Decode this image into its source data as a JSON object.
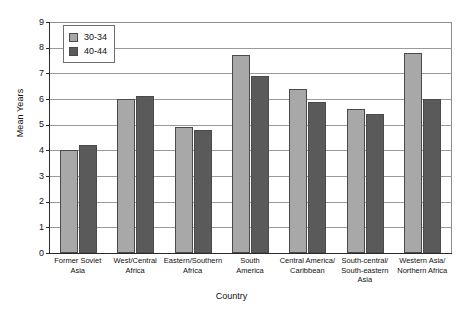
{
  "chart_data": {
    "type": "bar",
    "title": "",
    "xlabel": "Country",
    "ylabel": "Mean Years",
    "ylim": [
      0,
      9
    ],
    "yticks": [
      "0",
      "1",
      "2",
      "3",
      "4",
      "5",
      "6",
      "7",
      "8",
      "9"
    ],
    "grid": true,
    "legend_position": "top-left-inside",
    "categories": [
      "Former Soviet\nAsia",
      "West/Central\nAfrica",
      "Eastern/Southern\nAfrica",
      "South\nAmerica",
      "Central America/\nCaribbean",
      "South-central/\nSouth-eastern Asia",
      "Western Asia/\nNorthern Africa"
    ],
    "category_lines": [
      [
        "Former Soviet",
        "Asia"
      ],
      [
        "West/Central",
        "Africa"
      ],
      [
        "Eastern/Southern",
        "Africa"
      ],
      [
        "South",
        "America"
      ],
      [
        "Central America/",
        "Caribbean"
      ],
      [
        "South-central/",
        "South-eastern Asia"
      ],
      [
        "Western Asia/",
        "Northern Africa"
      ]
    ],
    "series": [
      {
        "name": "30-34",
        "color": "#a8a8a8",
        "values": [
          4.0,
          6.0,
          4.9,
          7.7,
          6.4,
          5.6,
          7.8
        ]
      },
      {
        "name": "40-44",
        "color": "#5a5a5a",
        "values": [
          4.2,
          6.1,
          4.8,
          6.9,
          5.9,
          5.4,
          6.0
        ]
      }
    ]
  },
  "colors": {
    "series_30_34": "#a8a8a8",
    "series_40_44": "#5a5a5a",
    "bar_outline": "#4a4a4a",
    "gridline": "#9a9a9a",
    "axis": "#2a2a2a",
    "background": "#ffffff"
  }
}
